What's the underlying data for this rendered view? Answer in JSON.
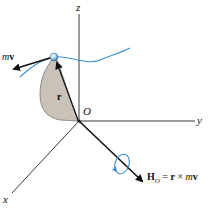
{
  "diagram": {
    "axes": {
      "z_label": "z",
      "y_label": "y",
      "x_label": "x",
      "origin_label": "O"
    },
    "vectors": {
      "position_label": "r",
      "momentum_label_m": "m",
      "momentum_label_v": "v",
      "angular_momentum": {
        "H": "H",
        "sub": "O",
        "eq": " = ",
        "r": "r",
        "times": " × ",
        "m": "m",
        "v": "v"
      }
    },
    "colors": {
      "trajectory": "#3a8fd0",
      "particle": "#8fc4ea",
      "shaded_area": "#c9c2b8",
      "axis": "#222222",
      "rotation_arrow": "#3a8fd0"
    }
  }
}
